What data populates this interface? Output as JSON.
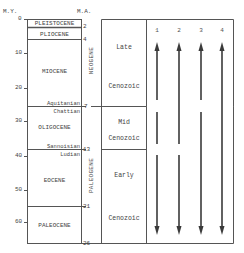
{
  "axis": {
    "left_title": "M.Y.",
    "right_title": "M.A.",
    "ticks": [
      {
        "label": "0",
        "y": 19
      },
      {
        "label": "10",
        "y": 53
      },
      {
        "label": "20",
        "y": 88
      },
      {
        "label": "30",
        "y": 121
      },
      {
        "label": "40",
        "y": 156
      },
      {
        "label": "50",
        "y": 190
      },
      {
        "label": "60",
        "y": 222
      }
    ]
  },
  "stages": {
    "pleistocene": "PLEISTOCENE",
    "pliocene": "PLIOCENE",
    "miocene": "MIOCENE",
    "aquitanian": "Aquitanian",
    "chattian": "Chattian",
    "oligocene": "OLIGOCENE",
    "sannoisian": "Sannoisian",
    "ludian": "Ludian",
    "eocene": "EOCENE",
    "paleocene": "PALEOCENE"
  },
  "ma_markers": {
    "m2": "2",
    "m4": "4",
    "m7": "7",
    "m13": "13",
    "m21": "21",
    "m26": "26"
  },
  "periods": {
    "neogene": "NEOGENE",
    "paleogene": "PALEOGENE"
  },
  "eras": {
    "late": {
      "line1": "Late",
      "line2": "Cenozoic"
    },
    "mid": {
      "line1": "Mid",
      "line2": "Cenozoic"
    },
    "early": {
      "line1": "Early",
      "line2": "Cenozoic"
    }
  },
  "arrows": {
    "labels": [
      "1",
      "2",
      "3",
      "4"
    ],
    "a1": "1",
    "a2": "2",
    "a3": "3",
    "a4": "4"
  }
}
